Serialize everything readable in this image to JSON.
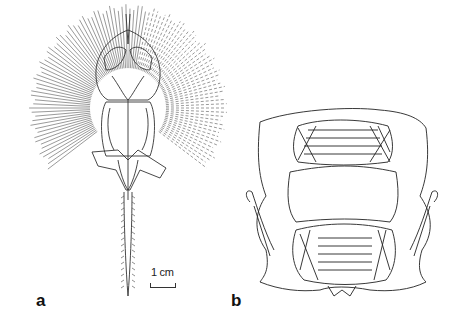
{
  "figure": {
    "panels": [
      {
        "id": "a",
        "label": "a",
        "subject": "ray skeleton, dorsal view"
      },
      {
        "id": "b",
        "label": "b",
        "subject": "jaw and branchial apparatus"
      }
    ],
    "scale_bar": {
      "label": "1 cm"
    }
  }
}
